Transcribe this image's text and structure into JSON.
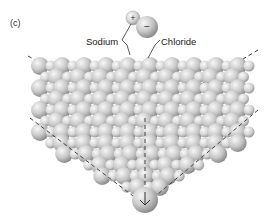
{
  "figure": {
    "panel_label": "(c)",
    "labels": {
      "sodium": "Sodium",
      "chloride": "Chloride"
    },
    "ion_signs": {
      "sodium": "+",
      "chloride": "−"
    },
    "colors": {
      "sphere_light": "#f2f2f2",
      "sphere_mid": "#c8c8c8",
      "sphere_dark": "#8f8f8f",
      "dashed_axis": "#444444",
      "label_text": "#222222"
    }
  }
}
